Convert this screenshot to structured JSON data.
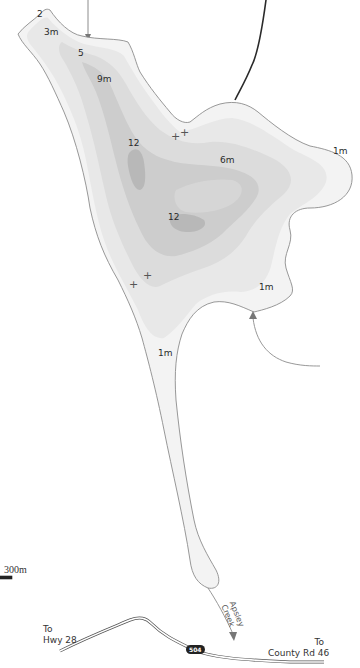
{
  "map": {
    "type": "lake bathymetric map",
    "colors": {
      "background": "#ffffff",
      "shoreline": "#8c8c8c",
      "depth_1m": "#f2f2f2",
      "depth_3m": "#e6e6e6",
      "depth_6m": "#d9d9d9",
      "depth_9m": "#cccccc",
      "depth_12m": "#b9b9b9",
      "road": "#555555",
      "highway_shield": "#222222"
    },
    "depth_labels": [
      {
        "text": "2",
        "x": 39,
        "y": 13
      },
      {
        "text": "3m",
        "x": 45,
        "y": 31
      },
      {
        "text": "5",
        "x": 78,
        "y": 51
      },
      {
        "text": "9m",
        "x": 97,
        "y": 77
      },
      {
        "text": "12",
        "x": 128,
        "y": 140
      },
      {
        "text": "6m",
        "x": 220,
        "y": 157
      },
      {
        "text": "12",
        "x": 168,
        "y": 214
      },
      {
        "text": "1m",
        "x": 333,
        "y": 148
      },
      {
        "text": "1m",
        "x": 259,
        "y": 285
      },
      {
        "text": "1m",
        "x": 158,
        "y": 350
      }
    ],
    "hazard_markers": [
      {
        "symbol": "+",
        "x": 175,
        "y": 137
      },
      {
        "symbol": "+",
        "x": 184,
        "y": 133
      },
      {
        "symbol": "+",
        "x": 133,
        "y": 285
      },
      {
        "symbol": "+",
        "x": 147,
        "y": 276
      }
    ],
    "roads": [
      {
        "label": "To\nHwy 28",
        "x": 43,
        "y": 626
      },
      {
        "label": "To\nCounty Rd 46",
        "x": 265,
        "y": 638
      }
    ],
    "highway_shield": {
      "label": "504",
      "x": 187,
      "y": 645
    },
    "creek": {
      "label": "Apsley\nCreek",
      "x": 224,
      "y": 604
    },
    "scale_bar": {
      "label": "300m",
      "x": 4,
      "y": 568
    }
  }
}
